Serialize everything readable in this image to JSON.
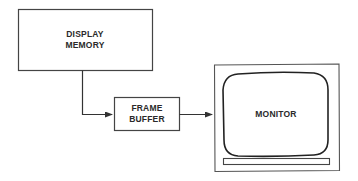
{
  "diagram": {
    "nodes": [
      {
        "id": "display_memory",
        "lines": [
          "DISPLAY",
          "MEMORY"
        ]
      },
      {
        "id": "frame_buffer",
        "lines": [
          "FRAME",
          "BUFFER"
        ]
      },
      {
        "id": "monitor",
        "lines": [
          "MONITOR"
        ]
      }
    ],
    "edges": [
      {
        "from": "display_memory",
        "to": "frame_buffer"
      },
      {
        "from": "frame_buffer",
        "to": "monitor"
      }
    ],
    "colors": {
      "stroke": "#333333",
      "background": "#ffffff",
      "text": "#2a2a2a"
    }
  }
}
